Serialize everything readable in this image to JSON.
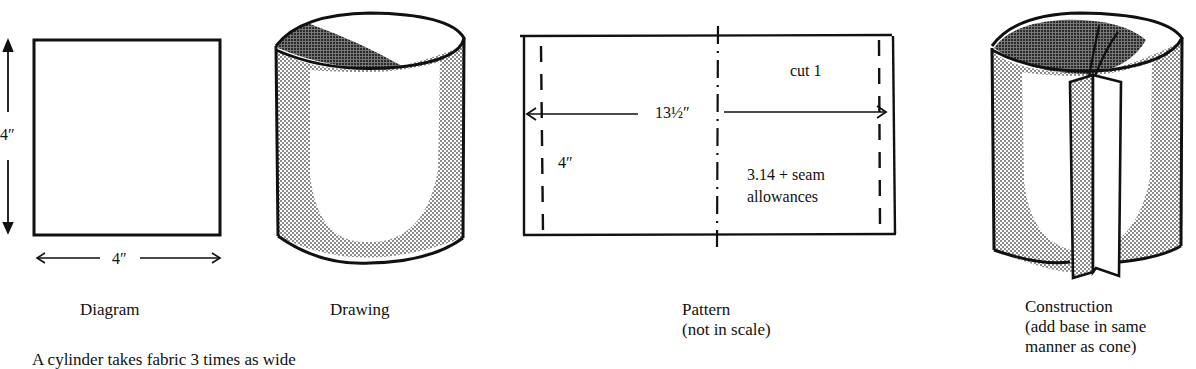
{
  "panels": {
    "diagram": {
      "caption": "Diagram",
      "height_label": "4″",
      "width_label": "4″"
    },
    "drawing": {
      "caption": "Drawing"
    },
    "pattern": {
      "caption_line1": "Pattern",
      "caption_line2": "(not in scale)",
      "cut_label": "cut 1",
      "width_label": "13½″",
      "height_label": "4″",
      "note_line1": "3.14 + seam",
      "note_line2": "allowances"
    },
    "construction": {
      "caption_line1": "Construction",
      "caption_line2": "(add base in same",
      "caption_line3": "manner as cone)"
    }
  },
  "footer_text": "A cylinder takes fabric 3 times as wide"
}
